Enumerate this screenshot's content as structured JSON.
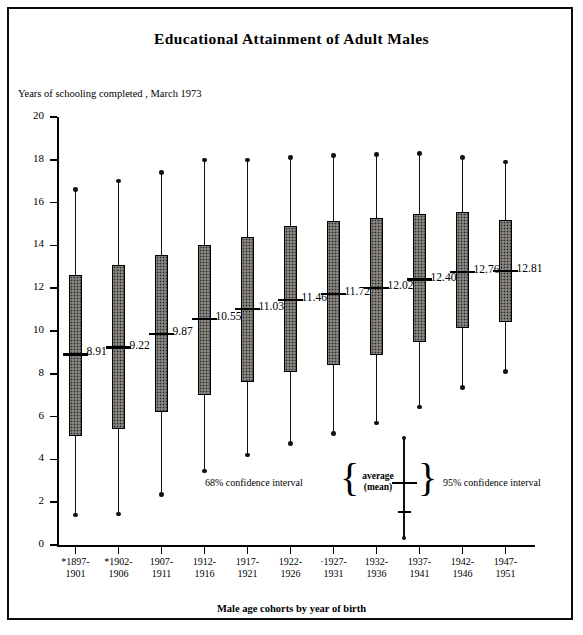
{
  "figure": {
    "title": "Educational Attainment of Adult Males",
    "ylabel": "Years of schooling completed , March 1973",
    "xlabel": "Male age cohorts by year of birth"
  },
  "legend": {
    "left": "68% confidence interval",
    "right": "95% confidence interval",
    "center_line1": "average",
    "center_line2": "(mean)",
    "brace_left": "{",
    "brace_right": "}"
  },
  "chart_data": {
    "type": "box",
    "title": "Educational Attainment of Adult Males",
    "xlabel": "Male age cohorts by year of birth",
    "ylabel": "Years of schooling completed , March 1973",
    "ylim": [
      0,
      20
    ],
    "yticks": [
      0,
      2,
      4,
      6,
      8,
      10,
      12,
      14,
      16,
      18,
      20
    ],
    "grid": false,
    "legend_position": "inside-bottom-center",
    "note": "Box = 68% confidence interval, whiskers = 95% confidence interval, horizontal tick = average (mean). Asterisk marks cohorts 1897-1901, 1902-1906 and 1927-1931.",
    "categories": [
      "*1897-\n1901",
      "*1902-\n1906",
      "1907-\n1911",
      "1912-\n1916",
      "1917-\n1921",
      "1922-\n1926",
      "·1927-\n1931",
      "1932-\n1936",
      "1937-\n1941",
      "1942-\n1946",
      "1947-\n1951"
    ],
    "points": [
      {
        "cohort": "1897-1901",
        "label_top": "*1897-",
        "label_bottom": "1901",
        "asterisk": true,
        "mean": 8.91,
        "mean_label": "8.91",
        "box_low": 5.1,
        "box_high": 12.6,
        "whisker_low": 1.4,
        "whisker_high": 16.6
      },
      {
        "cohort": "1902-1906",
        "label_top": "*1902-",
        "label_bottom": "1906",
        "asterisk": true,
        "mean": 9.22,
        "mean_label": "9.22",
        "box_low": 5.4,
        "box_high": 13.1,
        "whisker_low": 1.45,
        "whisker_high": 17.0
      },
      {
        "cohort": "1907-1911",
        "label_top": "1907-",
        "label_bottom": "1911",
        "asterisk": false,
        "mean": 9.87,
        "mean_label": "9.87",
        "box_low": 6.2,
        "box_high": 13.55,
        "whisker_low": 2.35,
        "whisker_high": 17.4
      },
      {
        "cohort": "1912-1916",
        "label_top": "1912-",
        "label_bottom": "1916",
        "asterisk": false,
        "mean": 10.55,
        "mean_label": "10.55",
        "box_low": 7.0,
        "box_high": 14.0,
        "whisker_low": 3.45,
        "whisker_high": 18.0
      },
      {
        "cohort": "1917-1921",
        "label_top": "1917-",
        "label_bottom": "1921",
        "asterisk": false,
        "mean": 11.03,
        "mean_label": "11.03",
        "box_low": 7.6,
        "box_high": 14.4,
        "whisker_low": 4.2,
        "whisker_high": 18.0
      },
      {
        "cohort": "1922-1926",
        "label_top": "1922-",
        "label_bottom": "1926",
        "asterisk": false,
        "mean": 11.46,
        "mean_label": "11.46",
        "box_low": 8.1,
        "box_high": 14.9,
        "whisker_low": 4.75,
        "whisker_high": 18.1
      },
      {
        "cohort": "1927-1931",
        "label_top": "·1927-",
        "label_bottom": "1931",
        "asterisk": true,
        "mean": 11.72,
        "mean_label": "11.72",
        "box_low": 8.4,
        "box_high": 15.15,
        "whisker_low": 5.2,
        "whisker_high": 18.2
      },
      {
        "cohort": "1932-1936",
        "label_top": "1932-",
        "label_bottom": "1936",
        "asterisk": false,
        "mean": 12.02,
        "mean_label": "12.02",
        "box_low": 8.9,
        "box_high": 15.3,
        "whisker_low": 5.7,
        "whisker_high": 18.25
      },
      {
        "cohort": "1937-1941",
        "label_top": "1937-",
        "label_bottom": "1941",
        "asterisk": false,
        "mean": 12.4,
        "mean_label": "12.40",
        "box_low": 9.5,
        "box_high": 15.45,
        "whisker_low": 6.45,
        "whisker_high": 18.3
      },
      {
        "cohort": "1942-1946",
        "label_top": "1942-",
        "label_bottom": "1946",
        "asterisk": false,
        "mean": 12.76,
        "mean_label": "12.76",
        "box_low": 10.15,
        "box_high": 15.55,
        "whisker_low": 7.35,
        "whisker_high": 18.1
      },
      {
        "cohort": "1947-1951",
        "label_top": "1947-",
        "label_bottom": "1951",
        "asterisk": false,
        "mean": 12.81,
        "mean_label": "12.81",
        "box_low": 10.4,
        "box_high": 15.2,
        "whisker_low": 8.1,
        "whisker_high": 17.9
      }
    ]
  }
}
